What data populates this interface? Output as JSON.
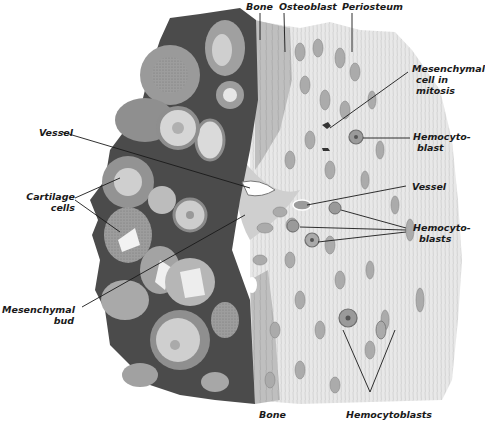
{
  "figure": {
    "colors": {
      "background": "#ffffff",
      "cartilage_matrix": "#4a4a4a",
      "cartilage_cell_capsule": "#9a9a9a",
      "cartilage_cell_interior": "#d8d8d8",
      "bone": "#bdbdbd",
      "periosteum": "#e6e6e6",
      "cell": "#a8a8a8",
      "leader_line": "#1a1a1a",
      "label_text": "#1a1a1a"
    }
  },
  "labels": {
    "bone_top": "Bone",
    "osteoblast": "Osteoblast",
    "periosteum": "Periosteum",
    "mesenchymal_mitosis_1": "Mesenchymal",
    "mesenchymal_mitosis_2": "cell in",
    "mesenchymal_mitosis_3": "mitosis",
    "hemocytoblast_1": "Hemocyto-",
    "hemocytoblast_2": "blast",
    "vessel_right": "Vessel",
    "hemocytoblasts_right_1": "Hemocyto-",
    "hemocytoblasts_right_2": "blasts",
    "vessel_left": "Vessel",
    "cartilage_cells_1": "Cartilage",
    "cartilage_cells_2": "cells",
    "mesenchymal_bud_1": "Mesenchymal",
    "mesenchymal_bud_2": "bud",
    "bone_bottom": "Bone",
    "hemocytoblasts_bottom": "Hemocytoblasts"
  }
}
